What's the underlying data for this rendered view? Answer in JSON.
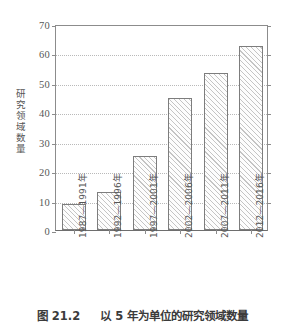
{
  "chart_data": {
    "type": "bar",
    "title": "",
    "categories": [
      "1987—1991年",
      "1992—1996年",
      "1997—2001年",
      "2002—2006年",
      "2007—2011年",
      "2012—2016年"
    ],
    "values": [
      9,
      13,
      25,
      45,
      53.5,
      62.5
    ],
    "xlabel": "",
    "ylabel": "研究领域数量",
    "ylim": [
      0,
      70
    ],
    "ytick_step": 10,
    "yticks": [
      0,
      10,
      20,
      30,
      40,
      50,
      60,
      70
    ],
    "ytick_labels": [
      "0",
      "10",
      "20",
      "30",
      "40",
      "50",
      "60",
      "70"
    ],
    "grid": "horizontal-dotted",
    "legend": null,
    "legend_position": "none",
    "bar_style": {
      "fill": "#fdfdfd",
      "hatch": "diagonal-forward",
      "hatch_color": "#969696",
      "edge_color": "#7d7d7d"
    },
    "axis_color": "#8c8c8c",
    "grid_color": "#b9b9b9"
  },
  "caption": {
    "figure_number": "图 21.2",
    "text": "以 5 年为单位的研究领域数量"
  }
}
